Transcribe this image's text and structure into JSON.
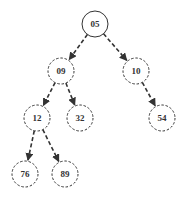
{
  "diagram": {
    "type": "binary-heap-tree",
    "colors": {
      "stroke": "#333333",
      "text": "#333333",
      "background": "#ffffff"
    },
    "nodes": [
      {
        "id": "n05",
        "label": "05",
        "x": 95,
        "y": 24,
        "style": "solid"
      },
      {
        "id": "n09",
        "label": "09",
        "x": 61,
        "y": 71,
        "style": "dashed"
      },
      {
        "id": "n10",
        "label": "10",
        "x": 136,
        "y": 71,
        "style": "dashed"
      },
      {
        "id": "n12",
        "label": "12",
        "x": 37,
        "y": 118,
        "style": "dashed"
      },
      {
        "id": "n32",
        "label": "32",
        "x": 80,
        "y": 118,
        "style": "dashed"
      },
      {
        "id": "n54",
        "label": "54",
        "x": 162,
        "y": 118,
        "style": "dashed"
      },
      {
        "id": "n76",
        "label": "76",
        "x": 25,
        "y": 174,
        "style": "dashed"
      },
      {
        "id": "n89",
        "label": "89",
        "x": 65,
        "y": 174,
        "style": "dashed"
      }
    ],
    "edges": [
      {
        "from": "n05",
        "to": "n09",
        "style": "dashed",
        "arrow": true
      },
      {
        "from": "n05",
        "to": "n10",
        "style": "dashed",
        "arrow": true
      },
      {
        "from": "n09",
        "to": "n12",
        "style": "dashed",
        "arrow": true
      },
      {
        "from": "n09",
        "to": "n32",
        "style": "dashed",
        "arrow": true
      },
      {
        "from": "n10",
        "to": "n54",
        "style": "dashed",
        "arrow": true
      },
      {
        "from": "n12",
        "to": "n76",
        "style": "dashed",
        "arrow": true
      },
      {
        "from": "n12",
        "to": "n89",
        "style": "dashed",
        "arrow": true
      }
    ]
  }
}
